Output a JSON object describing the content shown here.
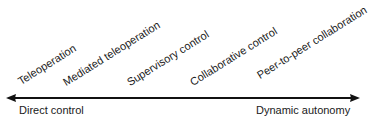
{
  "diagram": {
    "levels": [
      {
        "label": "Teleoperation"
      },
      {
        "label": "Mediated teleoperation"
      },
      {
        "label": "Supervisory control"
      },
      {
        "label": "Collaborative control"
      },
      {
        "label": "Peer-to-peer collaboration"
      }
    ],
    "axis": {
      "left_label": "Direct control",
      "right_label": "Dynamic autonomy",
      "direction": "bidirectional",
      "color": "#111111"
    }
  }
}
